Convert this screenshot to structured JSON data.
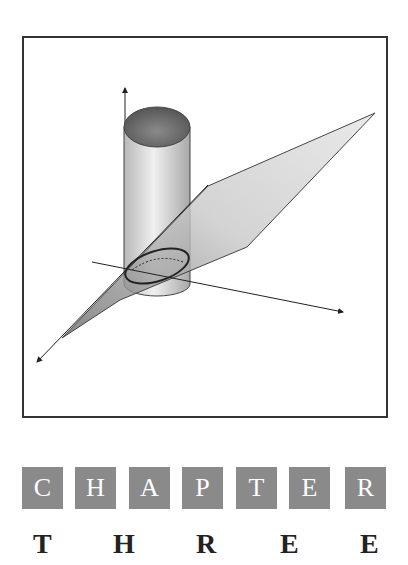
{
  "heading": {
    "chapter_letters": [
      "C",
      "H",
      "A",
      "P",
      "T",
      "E",
      "R"
    ],
    "number_letters": [
      "T",
      "H",
      "R",
      "E",
      "E"
    ],
    "box_color": "#8a8a8a"
  }
}
